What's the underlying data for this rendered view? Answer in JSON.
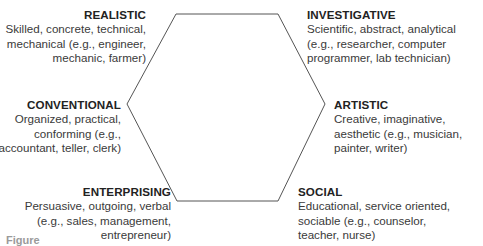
{
  "diagram": {
    "type": "hexagon",
    "line_color": "#555555",
    "vertices": [
      {
        "name": "top-left",
        "x": 176,
        "y": 14
      },
      {
        "name": "top-right",
        "x": 278,
        "y": 14
      },
      {
        "name": "right",
        "x": 325,
        "y": 104
      },
      {
        "name": "bottom-right",
        "x": 278,
        "y": 201
      },
      {
        "name": "bottom-left",
        "x": 177,
        "y": 201
      },
      {
        "name": "left",
        "x": 127,
        "y": 104
      }
    ]
  },
  "types": {
    "realistic": {
      "title": "REALISTIC",
      "lines": [
        "Skilled, concrete, technical,",
        "mechanical (e.g., engineer,",
        "mechanic, farmer)"
      ]
    },
    "investigative": {
      "title": "INVESTIGATIVE",
      "lines": [
        "Scientific, abstract, analytical",
        "(e.g., researcher, computer",
        "programmer, lab technician)"
      ]
    },
    "conventional": {
      "title": "CONVENTIONAL",
      "lines": [
        "Organized, practical,",
        "conforming (e.g.,",
        "accountant, teller, clerk)"
      ]
    },
    "artistic": {
      "title": "ARTISTIC",
      "lines": [
        "Creative, imaginative,",
        "aesthetic (e.g., musician,",
        "painter, writer)"
      ]
    },
    "enterprising": {
      "title": "ENTERPRISING",
      "lines": [
        "Persuasive, outgoing, verbal",
        "(e.g., sales, management,",
        "entrepreneur)"
      ]
    },
    "social": {
      "title": "SOCIAL",
      "lines": [
        "Educational, service oriented,",
        "sociable (e.g., counselor,",
        "teacher, nurse)"
      ]
    }
  },
  "caption": {
    "text": "Figure"
  }
}
